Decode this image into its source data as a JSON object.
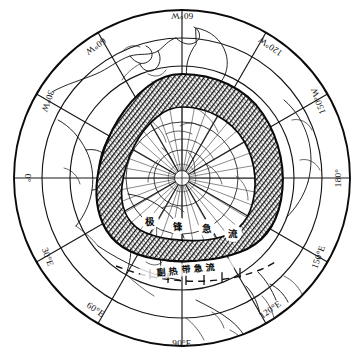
{
  "figure": {
    "name": "northern-hemisphere-polar-stereographic-jet-stream-map",
    "projection": "polar stereographic",
    "hemisphere": "Northern Hemisphere",
    "pole_marker": "North Pole",
    "background_color": "#ffffff",
    "ink_color": "#101010",
    "hatch_color": "#1a1a1a"
  },
  "graticule": {
    "meridian_labels": [
      {
        "id": "lon-060w",
        "text": "60°W",
        "angle_deg": 0,
        "rotation": 180,
        "x": 182,
        "y": 13
      },
      {
        "id": "lon-120w",
        "text": "120°W",
        "angle_deg": 60,
        "rotation": 240,
        "x": 268,
        "y": 42
      },
      {
        "id": "lon-150w",
        "text": "150°W",
        "angle_deg": 90,
        "rotation": 270,
        "x": 317,
        "y": 97
      },
      {
        "id": "lon-180",
        "text": "180°",
        "angle_deg": 120,
        "rotation": 270,
        "x": 340,
        "y": 178
      },
      {
        "id": "lon-150e",
        "text": "150°E",
        "angle_deg": 150,
        "rotation": 300,
        "x": 317,
        "y": 260
      },
      {
        "id": "lon-120e",
        "text": "120°E",
        "angle_deg": 180,
        "rotation": 330,
        "x": 268,
        "y": 313
      },
      {
        "id": "lon-090e",
        "text": "90°E",
        "angle_deg": 210,
        "rotation": 0,
        "x": 182,
        "y": 345
      },
      {
        "id": "lon-060e",
        "text": "60°E",
        "angle_deg": 240,
        "rotation": 30,
        "x": 96,
        "y": 313
      },
      {
        "id": "lon-030e",
        "text": "30°E",
        "angle_deg": 270,
        "rotation": 60,
        "x": 47,
        "y": 260
      },
      {
        "id": "lon-000",
        "text": "0°",
        "angle_deg": 300,
        "rotation": 90,
        "x": 24,
        "y": 178
      },
      {
        "id": "lon-030w",
        "text": "30°W",
        "angle_deg": 330,
        "rotation": 120,
        "x": 47,
        "y": 97
      },
      {
        "id": "lon-060w-2",
        "text": "60°W",
        "angle_deg": 350,
        "rotation": 150,
        "x": 96,
        "y": 42
      }
    ],
    "meridian_count": 12,
    "meridian_spacing_deg": 30,
    "parallel_rings": [
      {
        "id": "parallel-outer",
        "radius_px": 168
      },
      {
        "id": "parallel-1",
        "radius_px": 140
      },
      {
        "id": "parallel-2",
        "radius_px": 112
      },
      {
        "id": "parallel-3",
        "radius_px": 84
      },
      {
        "id": "parallel-4",
        "radius_px": 56
      },
      {
        "id": "parallel-5",
        "radius_px": 28
      }
    ],
    "parallel_spacing_deg": 15,
    "center": {
      "x": 182,
      "y": 178
    }
  },
  "annotations": {
    "jet_core_labels": [
      {
        "id": "jet-char-1",
        "text": "极",
        "x": 150,
        "y": 224
      },
      {
        "id": "jet-char-2",
        "text": "锋",
        "x": 178,
        "y": 229
      },
      {
        "id": "jet-char-3",
        "text": "急",
        "x": 207,
        "y": 231
      },
      {
        "id": "jet-char-4",
        "text": "流",
        "x": 233,
        "y": 236
      }
    ],
    "caption": {
      "id": "subtropical-jet-caption",
      "text": "副 热 带 急 流",
      "x": 186,
      "y": 272,
      "rotation": -6
    }
  },
  "features": {
    "polar_front_jet_band": {
      "name": "polar front jet stream band",
      "style": "dense hatched / shaded ring",
      "label": "极锋急流"
    },
    "subtropical_jet": {
      "name": "subtropical jet stream",
      "style": "dashed line with tick marks",
      "label": "副热带急流"
    },
    "coastlines": {
      "name": "continental coastlines",
      "style": "thin black outline"
    }
  }
}
